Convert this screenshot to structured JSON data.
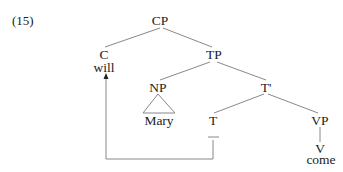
{
  "example_number": "(15)",
  "tree": {
    "nodes": {
      "cp": "CP",
      "c": "C",
      "c_word": "will",
      "tp": "TP",
      "np": "NP",
      "np_word": "Mary",
      "tbar": "T'",
      "t": "T",
      "t_trace": "—",
      "vp": "VP",
      "v": "V",
      "v_word": "come"
    },
    "movement": "T-to-C movement arrow from T position to C"
  }
}
